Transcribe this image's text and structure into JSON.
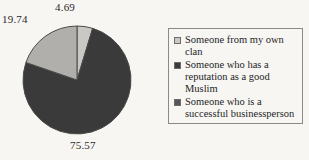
{
  "chart_data": {
    "type": "pie",
    "title": "",
    "categories": [
      "Someone from my own clan",
      "Someone who has a reputation as a good Muslim",
      "Someone who is a successful businessperson"
    ],
    "values": [
      4.69,
      75.57,
      19.74
    ],
    "labels": [
      "4.69",
      "75.57",
      "19.74"
    ],
    "colors": [
      "#c9c8c4",
      "#3a3a3a",
      "#b0afab"
    ],
    "legend_position": "right",
    "grid": false,
    "start_angle_deg": 0,
    "direction": "clockwise"
  },
  "pie": {
    "label_top": "4.69",
    "label_left": "19.74",
    "label_bottom": "75.57"
  },
  "legend": {
    "items": [
      {
        "label": "Someone from my own clan",
        "color": "#c9c8c4"
      },
      {
        "label": "Someone who has a reputation as a good Muslim",
        "color": "#3a3a3a"
      },
      {
        "label": "Someone who is a successful businessperson",
        "color": "#56565a"
      }
    ]
  }
}
